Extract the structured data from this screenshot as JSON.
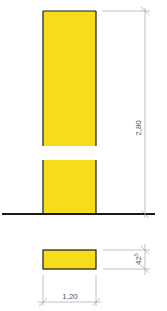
{
  "diagram": {
    "elevation": {
      "height_label": "2,80",
      "fill_color": "#f7dc1a",
      "outline_color": "#1a1a1a"
    },
    "plan": {
      "width_label": "1,20",
      "depth_label": "42",
      "depth_label_superscript": "5",
      "fill_color": "#f7dc1a"
    },
    "ground_line_color": "#1a1a1a",
    "dimension_line_color": "#999999"
  }
}
